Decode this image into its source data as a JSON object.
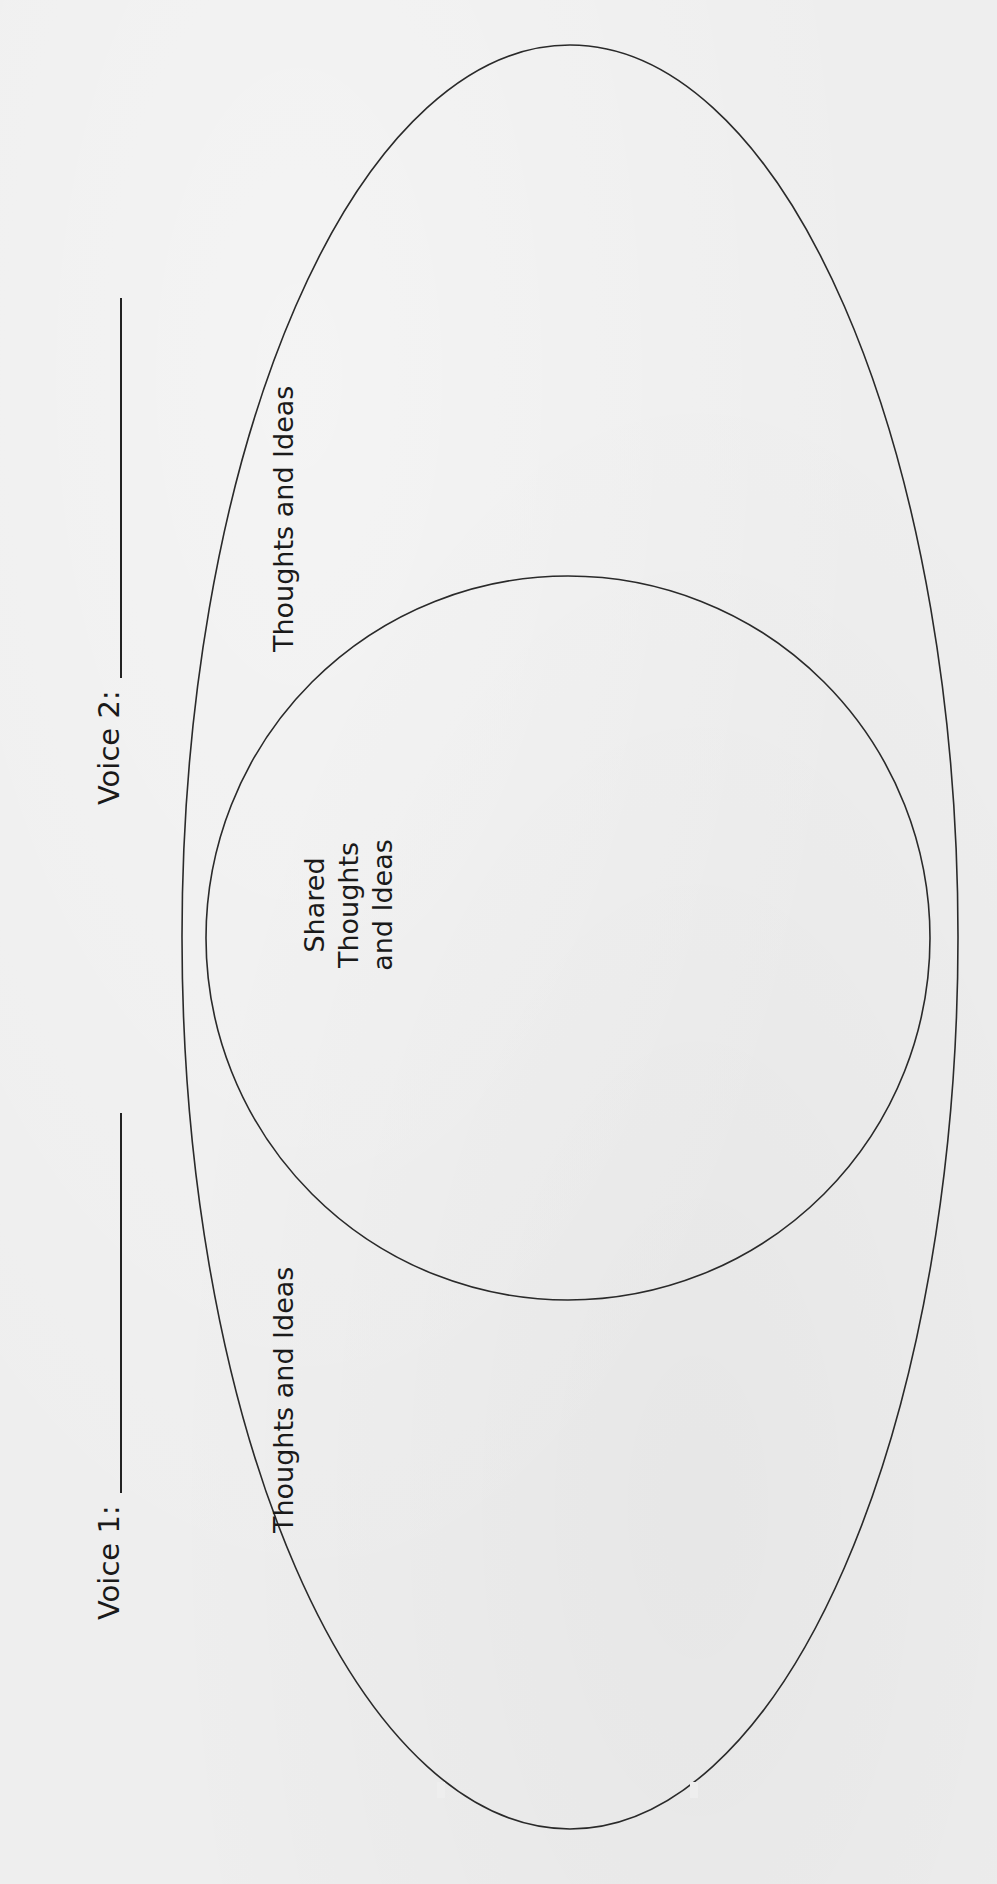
{
  "worksheet": {
    "voice_1": {
      "label": "Voice 1:",
      "value": ""
    },
    "voice_2": {
      "label": "Voice 2:",
      "value": ""
    },
    "regions": {
      "voice_1_only": "Thoughts and Ideas",
      "voice_2_only": "Thoughts and Ideas",
      "shared_line_1": "Shared Thoughts",
      "shared_line_2": "and Ideas"
    }
  },
  "colors": {
    "paper": "#eeeeee",
    "ink": "#1a1a1a"
  }
}
